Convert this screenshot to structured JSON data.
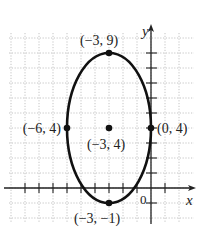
{
  "chart_data": {
    "type": "scatter",
    "title": "",
    "xlabel": "x",
    "ylabel": "y",
    "xlim": [
      -10,
      2
    ],
    "ylim": [
      -2,
      10
    ],
    "grid": true,
    "curve": {
      "kind": "ellipse",
      "center": [
        -3,
        4
      ],
      "semi_axis_x": 3,
      "semi_axis_y": 5
    },
    "points": [
      {
        "x": -3,
        "y": 9,
        "label": "(−3, 9)"
      },
      {
        "x": -6,
        "y": 4,
        "label": "(−6, 4)"
      },
      {
        "x": -3,
        "y": 4,
        "label": "(−3, 4)"
      },
      {
        "x": 0,
        "y": 4,
        "label": "(0, 4)"
      },
      {
        "x": -3,
        "y": -1,
        "label": "(−3, −1)"
      }
    ],
    "origin_label": "0",
    "x_ticks": [
      -9,
      -8,
      -7,
      -6,
      -5,
      -4,
      -3,
      -2,
      -1,
      1
    ],
    "y_ticks": [
      -1,
      1,
      2,
      3,
      4,
      5,
      6,
      7,
      8,
      9
    ]
  },
  "colors": {
    "curve": "#111111",
    "grid": "#b5b5b5",
    "axis": "#222222"
  }
}
